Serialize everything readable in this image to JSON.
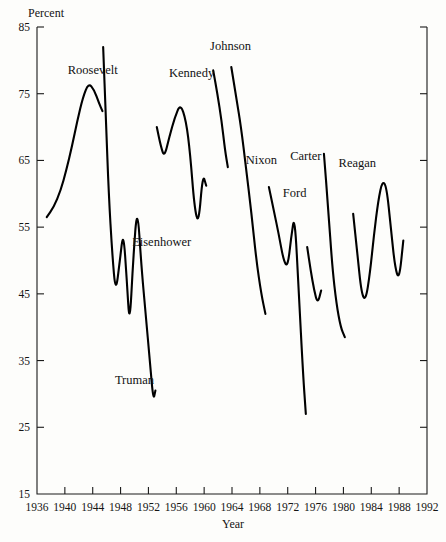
{
  "chart_data": {
    "type": "line",
    "title": "",
    "xlabel": "Year",
    "ylabel": "Percent",
    "ylabel_position": "top-left",
    "xlim": [
      1936,
      1992
    ],
    "ylim": [
      15,
      85
    ],
    "grid": false,
    "legend": "none",
    "legend_position": "inline-annotations",
    "y_ticks": [
      15,
      25,
      35,
      45,
      55,
      65,
      75,
      85
    ],
    "y_tick_labels": [
      "15",
      "25",
      "35",
      "45",
      "55",
      "65",
      "75",
      "85"
    ],
    "x_ticks": [
      1936,
      1940,
      1944,
      1948,
      1952,
      1956,
      1960,
      1964,
      1968,
      1972,
      1976,
      1980,
      1984,
      1988,
      1992
    ],
    "x_tick_labels": [
      "1936",
      "1940",
      "1944",
      "1948",
      "1952",
      "1956",
      "1960",
      "1964",
      "1968",
      "1972",
      "1976",
      "1980",
      "1984",
      "1988",
      "1992"
    ],
    "series": [
      {
        "name": "Roosevelt",
        "label": "Roosevelt",
        "label_x": 1944.0,
        "label_y": 78.0,
        "x": [
          1937.4,
          1938.4,
          1939.4,
          1940.2,
          1941.0,
          1941.8,
          1942.6,
          1943.4,
          1944.2,
          1944.9,
          1945.4
        ],
        "y": [
          56.5,
          58.0,
          60.5,
          63.5,
          67.0,
          71.0,
          74.5,
          76.6,
          75.6,
          73.6,
          72.4
        ]
      },
      {
        "name": "Truman",
        "label": "Truman",
        "label_x": 1950.0,
        "label_y": 31.5,
        "x": [
          1945.5,
          1945.9,
          1946.3,
          1946.8,
          1947.3,
          1947.9,
          1948.4,
          1948.9,
          1949.3,
          1949.8,
          1950.4,
          1951.0,
          1951.6,
          1952.2,
          1952.7,
          1953.0
        ],
        "y": [
          82.0,
          71.0,
          60.0,
          51.0,
          45.0,
          50.0,
          54.5,
          47.0,
          40.0,
          50.0,
          58.5,
          49.0,
          42.0,
          35.0,
          29.0,
          30.5
        ]
      },
      {
        "name": "Eisenhower",
        "label": "Eisenhower",
        "label_x": 1953.9,
        "label_y": 52.2,
        "x": [
          1953.2,
          1953.8,
          1954.3,
          1955.0,
          1955.8,
          1956.6,
          1957.4,
          1958.0,
          1958.6,
          1959.2,
          1959.8,
          1960.3
        ],
        "y": [
          70.0,
          67.0,
          65.5,
          68.5,
          71.5,
          73.5,
          71.0,
          66.0,
          58.0,
          55.3,
          63.0,
          61.2
        ]
      },
      {
        "name": "Kennedy",
        "label": "Kennedy",
        "label_x": 1958.2,
        "label_y": 77.5,
        "x": [
          1961.3,
          1961.9,
          1962.5,
          1963.0,
          1963.4
        ],
        "y": [
          78.5,
          75.0,
          71.0,
          66.5,
          64.0
        ]
      },
      {
        "name": "Johnson",
        "label": "Johnson",
        "label_x": 1963.8,
        "label_y": 81.5,
        "x": [
          1963.9,
          1964.6,
          1965.3,
          1966.0,
          1966.8,
          1967.5,
          1968.2,
          1968.8
        ],
        "y": [
          79.0,
          74.5,
          70.0,
          64.0,
          57.0,
          50.0,
          45.0,
          42.0
        ]
      },
      {
        "name": "Nixon",
        "label": "Nixon",
        "label_x": 1968.2,
        "label_y": 64.5,
        "x": [
          1969.3,
          1970.0,
          1970.7,
          1971.4,
          1972.0,
          1972.5,
          1973.0,
          1973.6,
          1974.2,
          1974.6
        ],
        "y": [
          61.0,
          57.5,
          54.0,
          50.0,
          49.0,
          53.5,
          57.0,
          45.0,
          33.0,
          27.0
        ]
      },
      {
        "name": "Ford",
        "label": "Ford",
        "label_x": 1973.0,
        "label_y": 59.5,
        "x": [
          1974.8,
          1975.3,
          1975.8,
          1976.3,
          1976.8
        ],
        "y": [
          52.0,
          48.5,
          45.5,
          43.5,
          45.5
        ]
      },
      {
        "name": "Carter",
        "label": "Carter",
        "label_x": 1974.6,
        "label_y": 65.0,
        "x": [
          1977.2,
          1977.8,
          1978.4,
          1979.0,
          1979.6,
          1980.2
        ],
        "y": [
          66.0,
          58.0,
          49.0,
          43.5,
          40.0,
          38.5
        ]
      },
      {
        "name": "Reagan",
        "label": "Reagan",
        "label_x": 1982.0,
        "label_y": 64.0,
        "x": [
          1981.4,
          1982.0,
          1982.6,
          1983.2,
          1983.8,
          1984.4,
          1985.0,
          1985.6,
          1986.2,
          1986.8,
          1987.4,
          1988.0,
          1988.6
        ],
        "y": [
          57.0,
          51.0,
          45.0,
          44.0,
          48.0,
          54.0,
          59.0,
          62.0,
          61.0,
          55.0,
          49.0,
          47.0,
          53.0
        ]
      }
    ]
  }
}
